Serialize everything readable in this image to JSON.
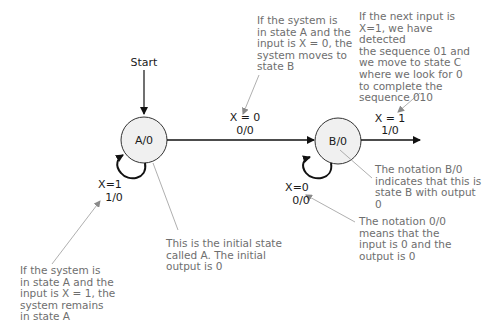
{
  "diagram": {
    "type": "finite-state-machine",
    "start_label": "Start",
    "states": [
      {
        "id": "A",
        "label": "A/0"
      },
      {
        "id": "B",
        "label": "B/0"
      }
    ],
    "transitions": [
      {
        "from": "A",
        "to": "B",
        "condition": "X = 0",
        "io": "0/0"
      },
      {
        "from": "A",
        "to": "A",
        "condition": "X=1",
        "io": "1/0"
      },
      {
        "from": "B",
        "to": "B",
        "condition": "X=0",
        "io": "0/0"
      },
      {
        "from": "B",
        "to": "C",
        "condition": "X = 1",
        "io": "1/0"
      }
    ],
    "annotations": {
      "a_to_b": "If the system is\nin state A and the\ninput is X = 0, the\nsystem moves to\nstate B",
      "b_to_c": "If the next input is\nX=1, we have detected\nthe sequence 01 and\nwe move to state C\nwhere we look for 0\nto complete the\nsequence 010",
      "b_notation": "The notation B/0\nindicates that this is\nstate B with output 0",
      "io_notation": "The notation 0/0\nmeans that the\ninput is 0 and the\noutput is 0",
      "initial_state": "This is the initial state\ncalled A. The initial\noutput is 0",
      "a_self_loop": "If the system is\nin state A and the\ninput is X = 1, the\nsystem remains\nin state A"
    },
    "colors": {
      "state_fill": "#f0f0f0",
      "line": "#111111",
      "annotation_text": "#6e6e6e",
      "annotation_line": "#9a9a9a"
    }
  }
}
